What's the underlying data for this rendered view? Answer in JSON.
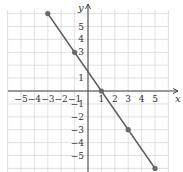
{
  "chart_data": {
    "type": "line",
    "title": "",
    "xlabel": "x",
    "ylabel": "y",
    "xlim": [
      -6,
      6
    ],
    "ylim": [
      -6,
      6
    ],
    "grid": true,
    "x_ticks": [
      "-5",
      "-4",
      "-3",
      "-2",
      "-1",
      "1",
      "2",
      "3",
      "4",
      "5"
    ],
    "y_ticks": [
      "5",
      "4",
      "3",
      "1",
      "-1",
      "-2",
      "-3",
      "-4",
      "-5"
    ],
    "series": [
      {
        "name": "line",
        "equation": "y = -3/2 x + 3/2",
        "points": [
          {
            "x": -3,
            "y": 6
          },
          {
            "x": -1,
            "y": 3
          },
          {
            "x": 1,
            "y": 0
          },
          {
            "x": 3,
            "y": -3
          },
          {
            "x": 5,
            "y": -6
          }
        ]
      }
    ]
  },
  "colors": {
    "line": "#5a5a5a",
    "point": "#6a6a6a",
    "grid": "#d9d9d9",
    "axis": "#444444"
  }
}
